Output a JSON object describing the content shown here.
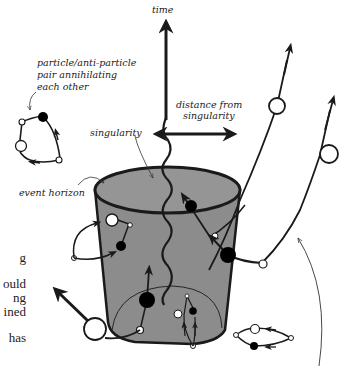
{
  "labels": {
    "time": "time",
    "distance_line1": "distance from",
    "distance_line2": "singularity",
    "pair_line1": "particle/anti-particle",
    "pair_line2": "pair annihilating",
    "pair_line3": "each other",
    "singularity": "singularity",
    "event_horizon": "event horizon"
  },
  "clipped_body_text": [
    "g",
    "ould",
    "ng",
    "ined",
    "has"
  ],
  "colors": {
    "hole_fill": "#8c8c8c",
    "ink": "#1a1a1a",
    "background": "#ffffff"
  }
}
